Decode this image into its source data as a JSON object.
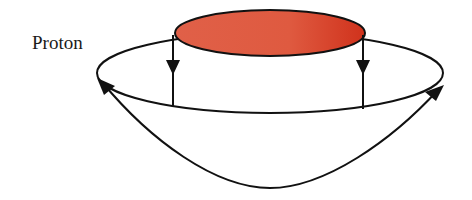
{
  "diagram": {
    "label": "Proton",
    "colors": {
      "disk_fill": "#d9402a",
      "disk_fill_light": "#e8684e",
      "stroke": "#111111",
      "background": "#ffffff"
    },
    "elements": {
      "top_disk": {
        "shape": "ellipse",
        "cx": 270,
        "cy": 33,
        "rx": 95,
        "ry": 23
      },
      "outer_ring": {
        "shape": "ellipse",
        "cx": 270,
        "cy": 73,
        "rx": 173,
        "ry": 40
      },
      "down_arrows": [
        {
          "x": 173,
          "y_top": 35,
          "y_bottom": 106,
          "arrowhead_y": 68
        },
        {
          "x": 363,
          "y_top": 35,
          "y_bottom": 106,
          "arrowhead_y": 68
        }
      ],
      "return_curve": {
        "start": [
          440,
          88
        ],
        "bottom": [
          270,
          188
        ],
        "end": [
          100,
          80
        ],
        "arrowheads": "both-ends"
      }
    }
  }
}
